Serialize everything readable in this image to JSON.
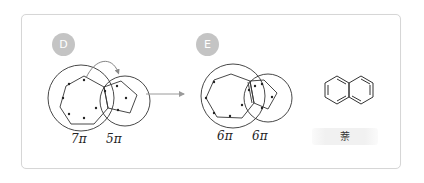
{
  "panels": {
    "left": {
      "badge": "D",
      "labels": {
        "seven_ring": "7π",
        "five_ring": "5π"
      }
    },
    "right": {
      "badge": "E",
      "labels": {
        "seven_ring": "6π",
        "five_ring": "6π"
      }
    },
    "compound": {
      "name": "萘"
    }
  },
  "colors": {
    "badge_bg": "#c4c4c4",
    "stroke": "#333333",
    "arrow": "#999999",
    "panel_border": "#d6d6d6"
  }
}
